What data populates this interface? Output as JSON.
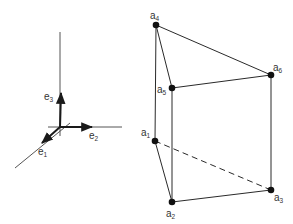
{
  "colors": {
    "background": "#ffffff",
    "stroke": "#2a2a2a",
    "axis": "#555555",
    "text": "#333333"
  },
  "basis": {
    "origin": [
      60,
      127
    ],
    "axes": {
      "vertical": {
        "from": [
          60,
          32
        ],
        "to": [
          60,
          136
        ]
      },
      "horizontal": {
        "from": [
          48,
          127
        ],
        "to": [
          122,
          127
        ]
      },
      "diagonal": {
        "from": [
          15,
          168
        ],
        "to": [
          70,
          123
        ]
      }
    },
    "vectors": [
      {
        "name": "e1",
        "base": "e",
        "sub": "1",
        "tip": [
          42,
          143
        ],
        "label_pos": [
          38,
          155
        ]
      },
      {
        "name": "e2",
        "base": "e",
        "sub": "2",
        "tip": [
          92,
          127
        ],
        "label_pos": [
          89,
          139
        ]
      },
      {
        "name": "e3",
        "base": "e",
        "sub": "3",
        "tip": [
          61,
          93
        ],
        "label_pos": [
          44,
          100
        ]
      }
    ]
  },
  "prism": {
    "vertices": [
      {
        "name": "a1",
        "base": "a",
        "sub": "1",
        "pos": [
          155,
          141
        ],
        "label_pos": [
          141,
          136
        ]
      },
      {
        "name": "a2",
        "base": "a",
        "sub": "2",
        "pos": [
          172,
          202
        ],
        "label_pos": [
          166,
          217
        ]
      },
      {
        "name": "a3",
        "base": "a",
        "sub": "3",
        "pos": [
          271,
          190
        ],
        "label_pos": [
          274,
          201
        ]
      },
      {
        "name": "a4",
        "base": "a",
        "sub": "4",
        "pos": [
          156,
          25
        ],
        "label_pos": [
          150,
          19
        ]
      },
      {
        "name": "a5",
        "base": "a",
        "sub": "5",
        "pos": [
          172,
          88
        ],
        "label_pos": [
          157,
          93
        ]
      },
      {
        "name": "a6",
        "base": "a",
        "sub": "6",
        "pos": [
          271,
          75
        ],
        "label_pos": [
          273,
          71
        ]
      }
    ],
    "edges": [
      {
        "from": "a4",
        "to": "a5",
        "style": "solid"
      },
      {
        "from": "a4",
        "to": "a6",
        "style": "solid"
      },
      {
        "from": "a5",
        "to": "a6",
        "style": "solid"
      },
      {
        "from": "a4",
        "to": "a1",
        "style": "solid"
      },
      {
        "from": "a5",
        "to": "a2",
        "style": "solid"
      },
      {
        "from": "a6",
        "to": "a3",
        "style": "solid"
      },
      {
        "from": "a1",
        "to": "a2",
        "style": "solid"
      },
      {
        "from": "a2",
        "to": "a3",
        "style": "solid"
      },
      {
        "from": "a1",
        "to": "a3",
        "style": "dashed"
      }
    ]
  }
}
